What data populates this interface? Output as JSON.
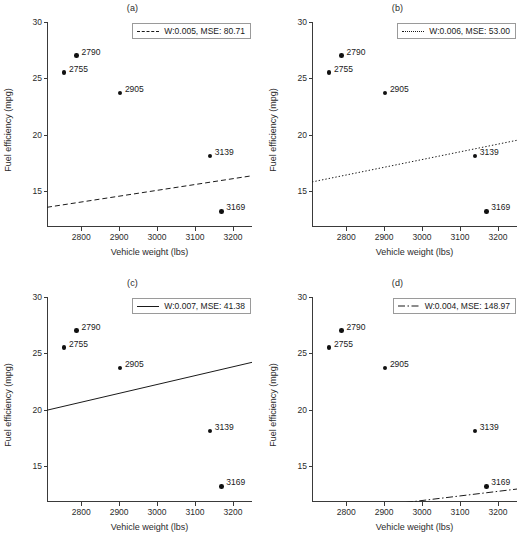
{
  "figure": {
    "width": 530,
    "height": 550,
    "background": "#ffffff",
    "point_color": "#111111",
    "line_color": "#1a1a1a",
    "axis_color": "#3a3a3a"
  },
  "chart_data": [
    {
      "type": "scatter",
      "title": "(a)",
      "xlabel": "Vehicle weight (lbs)",
      "ylabel": "Fuel efficiency (mpg)",
      "xlim": [
        2710,
        3250
      ],
      "ylim": [
        11.8,
        30
      ],
      "xticks": [
        2800,
        2900,
        3000,
        3100,
        3200
      ],
      "yticks": [
        15,
        20,
        25,
        30
      ],
      "grid": false,
      "legend_position": "upper right",
      "legend": "W:0.005, MSE: 80.71",
      "weight": 0.005,
      "mse": 80.71,
      "line_style": "dashed",
      "fit_line": {
        "x": [
          2710,
          3250
        ],
        "y": [
          13.55,
          16.35
        ]
      },
      "points": [
        {
          "label": "2755",
          "x": 2755,
          "y": 25.5
        },
        {
          "label": "2790",
          "x": 2788,
          "y": 27.0
        },
        {
          "label": "2905",
          "x": 2902,
          "y": 23.7
        },
        {
          "label": "3139",
          "x": 3139,
          "y": 18.1
        },
        {
          "label": "3169",
          "x": 3169,
          "y": 13.2
        }
      ]
    },
    {
      "type": "scatter",
      "title": "(b)",
      "xlabel": "Vehicle weight (lbs)",
      "ylabel": "Fuel efficiency (mpg)",
      "xlim": [
        2710,
        3250
      ],
      "ylim": [
        11.8,
        30
      ],
      "xticks": [
        2800,
        2900,
        3000,
        3100,
        3200
      ],
      "yticks": [
        15,
        20,
        25,
        30
      ],
      "grid": false,
      "legend_position": "upper right",
      "legend": "W:0.006, MSE: 53.00",
      "weight": 0.006,
      "mse": 53.0,
      "line_style": "dotted",
      "fit_line": {
        "x": [
          2710,
          3250
        ],
        "y": [
          15.8,
          19.5
        ]
      },
      "points": [
        {
          "label": "2755",
          "x": 2755,
          "y": 25.5
        },
        {
          "label": "2790",
          "x": 2788,
          "y": 27.0
        },
        {
          "label": "2905",
          "x": 2902,
          "y": 23.7
        },
        {
          "label": "3139",
          "x": 3139,
          "y": 18.1
        },
        {
          "label": "3169",
          "x": 3169,
          "y": 13.2
        }
      ]
    },
    {
      "type": "scatter",
      "title": "(c)",
      "xlabel": "Vehicle weight (lbs)",
      "ylabel": "Fuel efficiency (mpg)",
      "xlim": [
        2710,
        3250
      ],
      "ylim": [
        11.8,
        30
      ],
      "xticks": [
        2800,
        2900,
        3000,
        3100,
        3200
      ],
      "yticks": [
        15,
        20,
        25,
        30
      ],
      "grid": false,
      "legend_position": "upper right",
      "legend": "W:0.007, MSE: 41.38",
      "weight": 0.007,
      "mse": 41.38,
      "line_style": "solid",
      "fit_line": {
        "x": [
          2710,
          3250
        ],
        "y": [
          19.95,
          24.2
        ]
      },
      "points": [
        {
          "label": "2755",
          "x": 2755,
          "y": 25.5
        },
        {
          "label": "2790",
          "x": 2788,
          "y": 27.0
        },
        {
          "label": "2905",
          "x": 2902,
          "y": 23.7
        },
        {
          "label": "3139",
          "x": 3139,
          "y": 18.1
        },
        {
          "label": "3169",
          "x": 3169,
          "y": 13.2
        }
      ]
    },
    {
      "type": "scatter",
      "title": "(d)",
      "xlabel": "Vehicle weight (lbs)",
      "ylabel": "Fuel efficiency (mpg)",
      "xlim": [
        2710,
        3250
      ],
      "ylim": [
        11.8,
        30
      ],
      "xticks": [
        2800,
        2900,
        3000,
        3100,
        3200
      ],
      "yticks": [
        15,
        20,
        25,
        30
      ],
      "grid": false,
      "legend_position": "upper right",
      "legend": "W:0.004, MSE: 148.97",
      "weight": 0.004,
      "mse": 148.97,
      "line_style": "dashdot",
      "fit_line": {
        "x": [
          2710,
          3250
        ],
        "y": [
          10.75,
          12.95
        ]
      },
      "points": [
        {
          "label": "2755",
          "x": 2755,
          "y": 25.5
        },
        {
          "label": "2790",
          "x": 2788,
          "y": 27.0
        },
        {
          "label": "2905",
          "x": 2902,
          "y": 23.7
        },
        {
          "label": "3139",
          "x": 3139,
          "y": 18.1
        },
        {
          "label": "3169",
          "x": 3169,
          "y": 13.2
        }
      ]
    }
  ]
}
